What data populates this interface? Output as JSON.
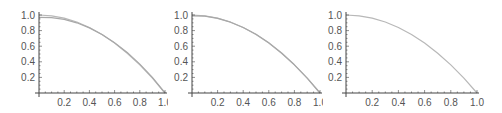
{
  "chart_data": [
    {
      "type": "line",
      "title": "",
      "xlabel": "",
      "ylabel": "",
      "xlim": [
        0,
        1.0
      ],
      "ylim": [
        0,
        1.0
      ],
      "x_ticks": [
        "0.2",
        "0.4",
        "0.6",
        "0.8",
        "1.0"
      ],
      "y_ticks": [
        "0.2",
        "0.4",
        "0.6",
        "0.8",
        "1.0"
      ],
      "grid": false,
      "legend": null,
      "series": [
        {
          "name": "curve-1",
          "x": [
            0,
            0.1,
            0.2,
            0.3,
            0.4,
            0.5,
            0.6,
            0.7,
            0.8,
            0.9,
            1.0
          ],
          "values": [
            1.0,
            0.99,
            0.96,
            0.91,
            0.84,
            0.75,
            0.64,
            0.51,
            0.36,
            0.19,
            0.0
          ]
        },
        {
          "name": "curve-2",
          "x": [
            0,
            0.1,
            0.2,
            0.3,
            0.4,
            0.5,
            0.6,
            0.7,
            0.8,
            0.9,
            1.0
          ],
          "values": [
            0.97,
            0.965,
            0.945,
            0.9,
            0.835,
            0.75,
            0.645,
            0.52,
            0.37,
            0.2,
            0.0
          ]
        }
      ]
    },
    {
      "type": "line",
      "title": "",
      "xlabel": "",
      "ylabel": "",
      "xlim": [
        0,
        1.0
      ],
      "ylim": [
        0,
        1.0
      ],
      "x_ticks": [
        "0.2",
        "0.4",
        "0.6",
        "0.8",
        "1.0"
      ],
      "y_ticks": [
        "0.2",
        "0.4",
        "0.6",
        "0.8",
        "1.0"
      ],
      "grid": false,
      "legend": null,
      "series": [
        {
          "name": "curve-1",
          "x": [
            0,
            0.1,
            0.2,
            0.3,
            0.4,
            0.5,
            0.6,
            0.7,
            0.8,
            0.9,
            1.0
          ],
          "values": [
            1.0,
            0.99,
            0.96,
            0.91,
            0.84,
            0.75,
            0.64,
            0.51,
            0.36,
            0.19,
            0.0
          ]
        },
        {
          "name": "curve-2",
          "x": [
            0,
            0.1,
            0.2,
            0.3,
            0.4,
            0.5,
            0.6,
            0.7,
            0.8,
            0.9,
            1.0
          ],
          "values": [
            0.99,
            0.985,
            0.957,
            0.908,
            0.84,
            0.752,
            0.643,
            0.513,
            0.362,
            0.191,
            0.0
          ]
        }
      ]
    },
    {
      "type": "line",
      "title": "",
      "xlabel": "",
      "ylabel": "",
      "xlim": [
        0,
        1.0
      ],
      "ylim": [
        0,
        1.0
      ],
      "x_ticks": [
        "0.2",
        "0.4",
        "0.6",
        "0.8",
        "1.0"
      ],
      "y_ticks": [
        "0.2",
        "0.4",
        "0.6",
        "0.8",
        "1.0"
      ],
      "grid": false,
      "legend": null,
      "series": [
        {
          "name": "curve-1",
          "x": [
            0,
            0.1,
            0.2,
            0.3,
            0.4,
            0.5,
            0.6,
            0.7,
            0.8,
            0.9,
            1.0
          ],
          "values": [
            1.0,
            0.99,
            0.96,
            0.91,
            0.84,
            0.75,
            0.64,
            0.51,
            0.36,
            0.19,
            0.0
          ]
        }
      ]
    }
  ],
  "style": {
    "axis_color": "#444444",
    "curve_colors": [
      "#b8b8b8",
      "#a8a8a8"
    ],
    "label_color": "#555555"
  }
}
